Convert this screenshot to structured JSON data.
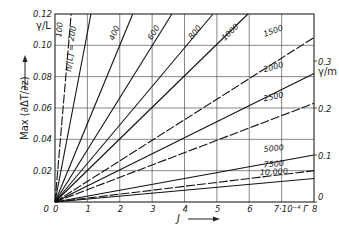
{
  "chart_data": {
    "type": "line",
    "title": "",
    "xlabel": "J",
    "x_unit_label": "7·10⁻⁴ Γ",
    "ylabel": "Max (∂ΔT/∂z)",
    "ylabel_left_unit": "γ/L",
    "ylabel_right_unit": "γ/m",
    "xlim": [
      0,
      8
    ],
    "ylim": [
      0,
      0.12
    ],
    "ylim_right": [
      0,
      0.3
    ],
    "grid": true,
    "x_ticks": [
      "0",
      "1",
      "2",
      "3",
      "4",
      "5",
      "6",
      "7·10⁻⁴ Γ",
      "8"
    ],
    "y_ticks_left": [
      "0",
      "0.02",
      "0.04",
      "0.06",
      "0.08",
      "0.10",
      "0.12"
    ],
    "y_ticks_right": [
      "0",
      "0.1",
      "0.2",
      "0.3"
    ],
    "parameter_label": "h/[L] =",
    "series": [
      {
        "name": "100",
        "style": "dashed",
        "x": [
          0,
          0.5
        ],
        "y": [
          0,
          0.12
        ]
      },
      {
        "name": "200",
        "style": "solid",
        "x": [
          0,
          1.11
        ],
        "y": [
          0,
          0.12
        ]
      },
      {
        "name": "400",
        "style": "solid",
        "x": [
          0,
          2.4
        ],
        "y": [
          0,
          0.12
        ]
      },
      {
        "name": "600",
        "style": "solid",
        "x": [
          0,
          3.61
        ],
        "y": [
          0,
          0.12
        ]
      },
      {
        "name": "800",
        "style": "solid",
        "x": [
          0,
          4.88
        ],
        "y": [
          0,
          0.12
        ]
      },
      {
        "name": "1000",
        "style": "solid",
        "x": [
          0,
          5.96
        ],
        "y": [
          0,
          0.12
        ]
      },
      {
        "name": "1500",
        "style": "dashed",
        "x": [
          0,
          8
        ],
        "y": [
          0,
          0.105
        ]
      },
      {
        "name": "2000",
        "style": "solid",
        "x": [
          0,
          8
        ],
        "y": [
          0,
          0.082
        ]
      },
      {
        "name": "2500",
        "style": "dashed",
        "x": [
          0,
          8
        ],
        "y": [
          0,
          0.063
        ]
      },
      {
        "name": "5000",
        "style": "solid",
        "x": [
          0,
          8
        ],
        "y": [
          0,
          0.03
        ]
      },
      {
        "name": "7500",
        "style": "dashed",
        "x": [
          0,
          8
        ],
        "y": [
          0,
          0.02
        ]
      },
      {
        "name": "10,000",
        "style": "solid",
        "x": [
          0,
          8
        ],
        "y": [
          0,
          0.015
        ]
      }
    ]
  }
}
